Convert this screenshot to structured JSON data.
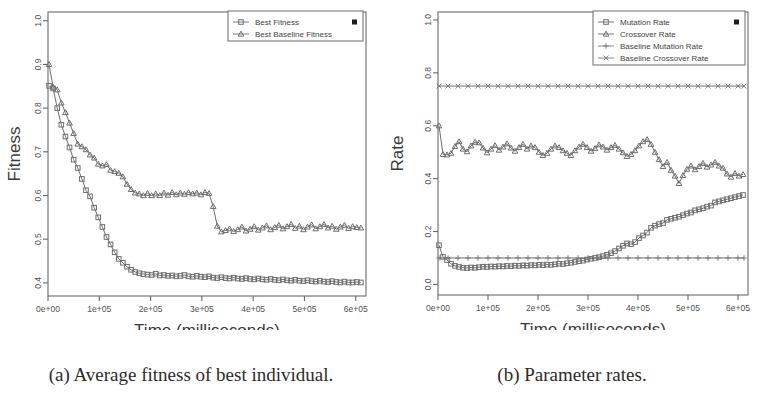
{
  "figure": {
    "panels": [
      {
        "id": "a",
        "caption": "(a) Average fitness of best individual.",
        "chart_index": 0
      },
      {
        "id": "b",
        "caption": "(b) Parameter rates.",
        "chart_index": 1
      }
    ]
  },
  "chart_data": [
    {
      "type": "line",
      "title": "",
      "xlabel": "Time (milliseconds)",
      "ylabel": "Fitness",
      "xlim": [
        0,
        620000
      ],
      "ylim": [
        0.37,
        1.02
      ],
      "xticks": [
        0,
        100000,
        200000,
        300000,
        400000,
        500000,
        600000
      ],
      "xticklabels": [
        "0e+00",
        "1e+05",
        "2e+05",
        "3e+05",
        "4e+05",
        "5e+05",
        "6e+05"
      ],
      "yticks": [
        0.4,
        0.5,
        0.6,
        0.7,
        0.8,
        0.9,
        1.0
      ],
      "yticklabels": [
        "0.4",
        "0.5",
        "0.6",
        "0.7",
        "0.8",
        "0.9",
        "1.0"
      ],
      "grid": false,
      "legend_position": "top-right",
      "legend_extra_marker": "black-square",
      "series": [
        {
          "name": "Best Fitness",
          "marker": "square",
          "color": "#6d6d6d",
          "x": [
            2000,
            10000,
            18000,
            26000,
            34000,
            42000,
            50000,
            58000,
            66000,
            74000,
            82000,
            90000,
            98000,
            106000,
            114000,
            122000,
            130000,
            138000,
            146000,
            154000,
            162000,
            170000,
            178000,
            186000,
            194000,
            202000,
            210000,
            218000,
            226000,
            234000,
            242000,
            250000,
            258000,
            266000,
            274000,
            282000,
            290000,
            298000,
            306000,
            314000,
            322000,
            330000,
            338000,
            346000,
            354000,
            362000,
            370000,
            378000,
            386000,
            394000,
            402000,
            410000,
            418000,
            426000,
            434000,
            442000,
            450000,
            458000,
            466000,
            474000,
            482000,
            490000,
            498000,
            506000,
            514000,
            522000,
            530000,
            538000,
            546000,
            554000,
            562000,
            570000,
            578000,
            586000,
            594000,
            602000,
            610000
          ],
          "y": [
            0.851,
            0.845,
            0.8,
            0.762,
            0.735,
            0.71,
            0.682,
            0.663,
            0.638,
            0.612,
            0.598,
            0.572,
            0.55,
            0.528,
            0.505,
            0.488,
            0.47,
            0.455,
            0.446,
            0.437,
            0.43,
            0.425,
            0.422,
            0.42,
            0.419,
            0.418,
            0.421,
            0.417,
            0.418,
            0.416,
            0.417,
            0.415,
            0.416,
            0.418,
            0.415,
            0.414,
            0.416,
            0.414,
            0.413,
            0.415,
            0.412,
            0.411,
            0.413,
            0.411,
            0.41,
            0.412,
            0.41,
            0.409,
            0.411,
            0.409,
            0.408,
            0.41,
            0.408,
            0.407,
            0.409,
            0.407,
            0.406,
            0.408,
            0.406,
            0.405,
            0.407,
            0.405,
            0.404,
            0.406,
            0.404,
            0.403,
            0.405,
            0.403,
            0.402,
            0.404,
            0.402,
            0.401,
            0.403,
            0.401,
            0.401,
            0.402,
            0.401
          ]
        },
        {
          "name": "Best Baseline Fitness",
          "marker": "triangle",
          "color": "#6d6d6d",
          "x": [
            2000,
            10000,
            18000,
            26000,
            34000,
            42000,
            50000,
            58000,
            66000,
            74000,
            82000,
            90000,
            98000,
            106000,
            114000,
            122000,
            130000,
            138000,
            146000,
            154000,
            162000,
            170000,
            178000,
            186000,
            194000,
            202000,
            210000,
            218000,
            226000,
            234000,
            242000,
            250000,
            258000,
            266000,
            274000,
            282000,
            290000,
            298000,
            306000,
            314000,
            322000,
            330000,
            338000,
            346000,
            354000,
            362000,
            370000,
            378000,
            386000,
            394000,
            402000,
            410000,
            418000,
            426000,
            434000,
            442000,
            450000,
            458000,
            466000,
            474000,
            482000,
            490000,
            498000,
            506000,
            514000,
            522000,
            530000,
            538000,
            546000,
            554000,
            562000,
            570000,
            578000,
            586000,
            594000,
            602000,
            610000
          ],
          "y": [
            0.9,
            0.848,
            0.842,
            0.812,
            0.79,
            0.766,
            0.742,
            0.718,
            0.712,
            0.705,
            0.693,
            0.686,
            0.672,
            0.668,
            0.671,
            0.658,
            0.655,
            0.651,
            0.643,
            0.626,
            0.614,
            0.606,
            0.604,
            0.6,
            0.605,
            0.6,
            0.604,
            0.6,
            0.606,
            0.601,
            0.607,
            0.602,
            0.606,
            0.603,
            0.607,
            0.604,
            0.606,
            0.602,
            0.607,
            0.605,
            0.575,
            0.53,
            0.517,
            0.52,
            0.524,
            0.518,
            0.522,
            0.528,
            0.519,
            0.523,
            0.529,
            0.521,
            0.526,
            0.531,
            0.522,
            0.527,
            0.532,
            0.524,
            0.529,
            0.534,
            0.525,
            0.53,
            0.522,
            0.528,
            0.533,
            0.524,
            0.529,
            0.534,
            0.526,
            0.53,
            0.523,
            0.528,
            0.532,
            0.525,
            0.529,
            0.527,
            0.526
          ]
        }
      ]
    },
    {
      "type": "line",
      "title": "",
      "xlabel": "Time (milliseconds)",
      "ylabel": "Rate",
      "xlim": [
        0,
        620000
      ],
      "ylim": [
        -0.04,
        1.03
      ],
      "xticks": [
        0,
        100000,
        200000,
        300000,
        400000,
        500000,
        600000
      ],
      "xticklabels": [
        "0e+00",
        "1e+05",
        "2e+05",
        "3e+05",
        "4e+05",
        "5e+05",
        "6e+05"
      ],
      "yticks": [
        0.0,
        0.2,
        0.4,
        0.6,
        0.8,
        1.0
      ],
      "yticklabels": [
        "0.0",
        "0.2",
        "0.4",
        "0.6",
        "0.8",
        "1.0"
      ],
      "grid": false,
      "legend_position": "top-right",
      "legend_extra_marker": "black-square",
      "series": [
        {
          "name": "Mutation Rate",
          "marker": "square",
          "color": "#6d6d6d",
          "x": [
            2000,
            10000,
            18000,
            26000,
            34000,
            42000,
            50000,
            58000,
            66000,
            74000,
            82000,
            90000,
            98000,
            106000,
            114000,
            122000,
            130000,
            138000,
            146000,
            154000,
            162000,
            170000,
            178000,
            186000,
            194000,
            202000,
            210000,
            218000,
            226000,
            234000,
            242000,
            250000,
            258000,
            266000,
            274000,
            282000,
            290000,
            298000,
            306000,
            314000,
            322000,
            330000,
            338000,
            346000,
            354000,
            362000,
            370000,
            378000,
            386000,
            394000,
            402000,
            410000,
            418000,
            426000,
            434000,
            442000,
            450000,
            458000,
            466000,
            474000,
            482000,
            490000,
            498000,
            506000,
            514000,
            522000,
            530000,
            538000,
            546000,
            554000,
            562000,
            570000,
            578000,
            586000,
            594000,
            602000,
            610000
          ],
          "y": [
            0.148,
            0.104,
            0.092,
            0.078,
            0.07,
            0.066,
            0.063,
            0.062,
            0.064,
            0.063,
            0.065,
            0.067,
            0.066,
            0.068,
            0.067,
            0.069,
            0.068,
            0.07,
            0.069,
            0.071,
            0.07,
            0.072,
            0.071,
            0.073,
            0.072,
            0.074,
            0.073,
            0.075,
            0.074,
            0.076,
            0.078,
            0.077,
            0.08,
            0.082,
            0.085,
            0.088,
            0.09,
            0.094,
            0.097,
            0.1,
            0.103,
            0.107,
            0.112,
            0.118,
            0.126,
            0.136,
            0.146,
            0.155,
            0.152,
            0.16,
            0.175,
            0.185,
            0.196,
            0.214,
            0.222,
            0.228,
            0.232,
            0.244,
            0.248,
            0.252,
            0.256,
            0.262,
            0.268,
            0.272,
            0.28,
            0.284,
            0.288,
            0.294,
            0.298,
            0.31,
            0.314,
            0.318,
            0.322,
            0.326,
            0.33,
            0.334,
            0.338,
            0.342
          ]
        },
        {
          "name": "Crossover Rate",
          "marker": "triangle",
          "color": "#6d6d6d",
          "x": [
            2000,
            10000,
            18000,
            26000,
            34000,
            42000,
            50000,
            58000,
            66000,
            74000,
            82000,
            90000,
            98000,
            106000,
            114000,
            122000,
            130000,
            138000,
            146000,
            154000,
            162000,
            170000,
            178000,
            186000,
            194000,
            202000,
            210000,
            218000,
            226000,
            234000,
            242000,
            250000,
            258000,
            266000,
            274000,
            282000,
            290000,
            298000,
            306000,
            314000,
            322000,
            330000,
            338000,
            346000,
            354000,
            362000,
            370000,
            378000,
            386000,
            394000,
            402000,
            410000,
            418000,
            426000,
            434000,
            442000,
            450000,
            458000,
            466000,
            474000,
            482000,
            490000,
            498000,
            506000,
            514000,
            522000,
            530000,
            538000,
            546000,
            554000,
            562000,
            570000,
            578000,
            586000,
            594000,
            602000,
            610000
          ],
          "y": [
            0.6,
            0.492,
            0.49,
            0.496,
            0.522,
            0.54,
            0.512,
            0.502,
            0.524,
            0.538,
            0.536,
            0.516,
            0.498,
            0.512,
            0.525,
            0.508,
            0.52,
            0.532,
            0.516,
            0.504,
            0.518,
            0.53,
            0.512,
            0.524,
            0.518,
            0.5,
            0.488,
            0.496,
            0.512,
            0.524,
            0.518,
            0.506,
            0.496,
            0.488,
            0.506,
            0.52,
            0.53,
            0.518,
            0.504,
            0.514,
            0.528,
            0.52,
            0.508,
            0.518,
            0.526,
            0.512,
            0.498,
            0.484,
            0.492,
            0.506,
            0.524,
            0.54,
            0.548,
            0.53,
            0.5,
            0.472,
            0.446,
            0.462,
            0.432,
            0.41,
            0.382,
            0.412,
            0.436,
            0.448,
            0.434,
            0.446,
            0.458,
            0.444,
            0.452,
            0.462,
            0.448,
            0.44,
            0.418,
            0.406,
            0.42,
            0.41,
            0.416,
            0.424
          ]
        },
        {
          "name": "Baseline Mutation Rate",
          "marker": "plus",
          "color": "#7b7b7b",
          "x": [
            2000,
            20000,
            40000,
            60000,
            80000,
            100000,
            120000,
            140000,
            160000,
            180000,
            200000,
            220000,
            240000,
            260000,
            280000,
            300000,
            320000,
            340000,
            360000,
            380000,
            400000,
            420000,
            440000,
            460000,
            480000,
            500000,
            520000,
            540000,
            560000,
            580000,
            600000,
            612000
          ],
          "y": [
            0.1,
            0.1,
            0.1,
            0.1,
            0.1,
            0.1,
            0.1,
            0.1,
            0.1,
            0.1,
            0.1,
            0.1,
            0.1,
            0.1,
            0.1,
            0.1,
            0.1,
            0.1,
            0.1,
            0.1,
            0.1,
            0.1,
            0.1,
            0.1,
            0.1,
            0.1,
            0.1,
            0.1,
            0.1,
            0.1,
            0.1,
            0.1
          ]
        },
        {
          "name": "Baseline Crossover Rate",
          "marker": "x",
          "color": "#7b7b7b",
          "x": [
            2000,
            20000,
            40000,
            60000,
            80000,
            100000,
            120000,
            140000,
            160000,
            180000,
            200000,
            220000,
            240000,
            260000,
            280000,
            300000,
            320000,
            340000,
            360000,
            380000,
            400000,
            420000,
            440000,
            460000,
            480000,
            500000,
            520000,
            540000,
            560000,
            580000,
            600000,
            612000
          ],
          "y": [
            0.75,
            0.75,
            0.75,
            0.75,
            0.75,
            0.75,
            0.75,
            0.75,
            0.75,
            0.75,
            0.75,
            0.75,
            0.75,
            0.75,
            0.75,
            0.75,
            0.75,
            0.75,
            0.75,
            0.75,
            0.75,
            0.75,
            0.75,
            0.75,
            0.75,
            0.75,
            0.75,
            0.75,
            0.75,
            0.75,
            0.75,
            0.75
          ]
        }
      ]
    }
  ]
}
